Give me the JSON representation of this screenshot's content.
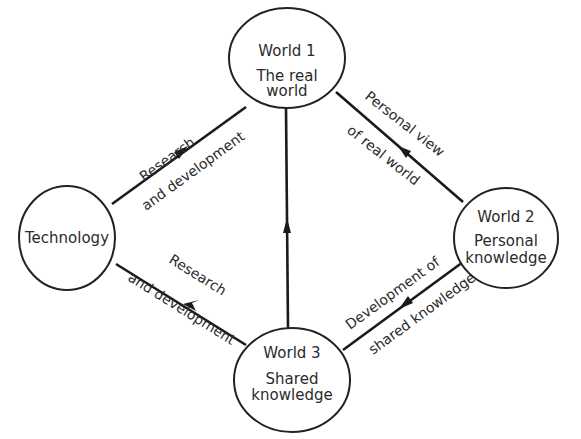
{
  "nodes": {
    "world1": {
      "title": "World 1",
      "line1": "The real",
      "line2": "world"
    },
    "technology": {
      "title": "Technology"
    },
    "world2": {
      "title": "World 2",
      "line1": "Personal",
      "line2": "knowledge"
    },
    "world3": {
      "title": "World 3",
      "line1": "Shared",
      "line2": "knowledge"
    }
  },
  "edges": {
    "tech_to_world1": {
      "from": "Technology",
      "to": "World 1",
      "label_top": "Research",
      "label_bottom": "and development"
    },
    "world3_to_tech": {
      "from": "World 3",
      "to": "Technology",
      "label_top": "Research",
      "label_bottom": "and development"
    },
    "world2_to_world1": {
      "from": "World 2",
      "to": "World 1",
      "label_top": "Personal view",
      "label_bottom": "of real world"
    },
    "world2_to_world3": {
      "from": "World 2",
      "to": "World 3",
      "label_top": "Development of",
      "label_bottom": "shared knowledge"
    },
    "world3_to_world1": {
      "from": "World 3",
      "to": "World 1"
    }
  },
  "colors": {
    "line": "#1a1a1a",
    "text": "#2b2b2b",
    "background": "#ffffff"
  }
}
